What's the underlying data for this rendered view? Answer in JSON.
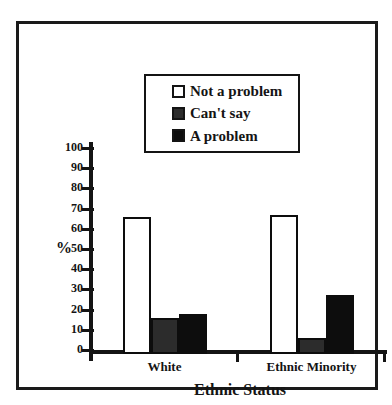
{
  "chart_data": {
    "type": "bar",
    "title": "",
    "categories": [
      "White",
      "Ethnic Minority"
    ],
    "series": [
      {
        "name": "Not a problem",
        "color": "#ffffff",
        "values": [
          66,
          67
        ]
      },
      {
        "name": "Can't say",
        "color": "#2c2c2c",
        "values": [
          16,
          6
        ]
      },
      {
        "name": "A problem",
        "color": "#0d0d0d",
        "values": [
          18,
          27
        ]
      }
    ],
    "xlabel": "Ethnic Status",
    "ylabel": "%",
    "ylim": [
      0,
      100
    ],
    "yticks": [
      0,
      10,
      20,
      30,
      40,
      50,
      60,
      70,
      80,
      90,
      100
    ],
    "grid": false,
    "legend_position": "top-center",
    "frame_color": "#1a1a1a",
    "axis_color": "#141414"
  }
}
